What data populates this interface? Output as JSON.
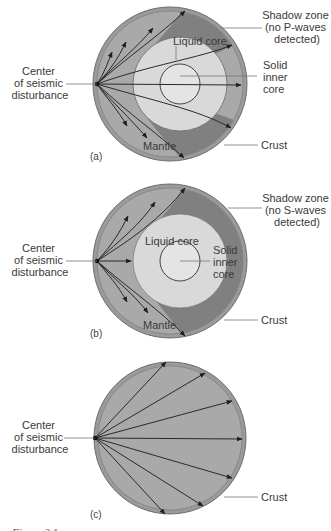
{
  "colors": {
    "crust": "#9a9a9a",
    "crust_edge": "#6e6e6e",
    "mantle": "#a9a9a9",
    "shadow_zone": "#808080",
    "liquid_core": "#d9d9d9",
    "inner_core": "#e4e4e4",
    "ray": "#2a2a2a"
  },
  "panels": [
    {
      "id": "a",
      "label": "(a)",
      "shadow_label": [
        "Shadow zone",
        "(no P-waves",
        "detected)"
      ],
      "center_label": [
        "Center",
        "of seismic",
        "disturbance"
      ],
      "liquid_core_label": "Liquid core",
      "inner_core_label": [
        "Solid",
        "inner",
        "core"
      ],
      "mantle_label": "Mantle",
      "crust_label": "Crust"
    },
    {
      "id": "b",
      "label": "(b)",
      "shadow_label": [
        "Shadow zone",
        "(no S-waves",
        "detected)"
      ],
      "center_label": [
        "Center",
        "of seismic",
        "disturbance"
      ],
      "liquid_core_label": "Liquid core",
      "inner_core_label": [
        "Solid",
        "inner",
        "core"
      ],
      "mantle_label": "Mantle",
      "crust_label": "Crust"
    },
    {
      "id": "c",
      "label": "(c)",
      "center_label": [
        "Center",
        "of seismic",
        "disturbance"
      ],
      "crust_label": "Crust"
    }
  ],
  "caption": "Figure 2.1"
}
